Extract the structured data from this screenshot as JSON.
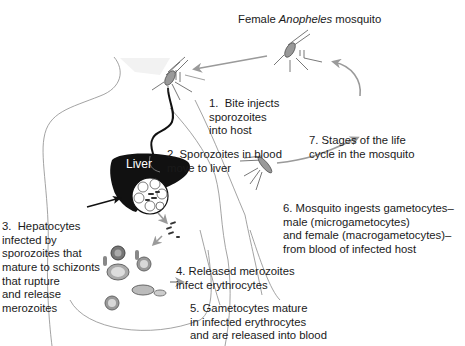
{
  "title": {
    "prefix": "Female ",
    "genus": "Anopheles",
    "suffix": " mosquito"
  },
  "organ_label": "Liver",
  "steps": [
    {
      "id": 1,
      "lines": [
        "1.  Bite injects",
        "sporozoites",
        "into host"
      ]
    },
    {
      "id": 2,
      "lines": [
        "2. Sporozoites in blood",
        "move to liver"
      ]
    },
    {
      "id": 3,
      "lines": [
        "3.  Hepatocytes",
        "infected by",
        "sporozoites that",
        "mature to schizonts",
        "that rupture",
        "and release",
        "merozoites"
      ]
    },
    {
      "id": 4,
      "lines": [
        "4. Released merozoites",
        "infect erythrocytes"
      ]
    },
    {
      "id": 5,
      "lines": [
        "5. Gametocytes mature",
        "in infected erythrocytes",
        "and are released into blood"
      ]
    },
    {
      "id": 6,
      "lines": [
        "6. Mosquito ingests gametocytes–",
        "male (microgametocytes)",
        "and female (macrogametocytes)–",
        "from blood of infected host"
      ]
    },
    {
      "id": 7,
      "lines": [
        "7. Stages of the life",
        "cycle in the mosquito"
      ]
    }
  ],
  "colors": {
    "arrow": "#9a9a9a",
    "liver": "#111111",
    "outline": "#8c8c8c",
    "text": "#1a1a1a"
  }
}
